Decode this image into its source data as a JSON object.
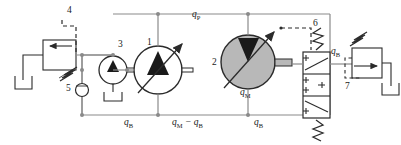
{
  "diagram": {
    "type": "hydraulic-schematic",
    "colors": {
      "line": "#8a8a8a",
      "dark_line": "#2b2b2b",
      "fill_gray": "#b8b8b8",
      "text": "#1a1a1a",
      "background": "#ffffff"
    },
    "components": [
      {
        "id": "1",
        "label": "1",
        "name": "variable-displacement-pump",
        "symbol": "circle-with-up-triangle-and-diagonal-arrow",
        "fill": "white"
      },
      {
        "id": "2",
        "label": "2",
        "name": "variable-displacement-motor",
        "symbol": "circle-with-down-triangle-and-diagonal-arrow",
        "fill": "gray"
      },
      {
        "id": "3",
        "label": "3",
        "name": "charge-pump",
        "symbol": "circle-with-up-triangle",
        "fill": "white"
      },
      {
        "id": "4",
        "label": "4",
        "name": "relief-valve-pilot-line",
        "symbol": "dashed-pilot-line"
      },
      {
        "id": "5",
        "label": "5",
        "name": "check-valve",
        "symbol": "circle-on-line"
      },
      {
        "id": "6",
        "label": "6",
        "name": "three-position-directional-valve",
        "symbol": "3-position-spring-centered-valve"
      },
      {
        "id": "7",
        "label": "7",
        "name": "relief-valve-pilot-line",
        "symbol": "dashed-pilot-line"
      }
    ],
    "flow_labels": [
      {
        "id": "qP",
        "base": "q",
        "sub": "P",
        "x": 196,
        "y": 12,
        "desc": "pump-flow-top-rail"
      },
      {
        "id": "qB-left",
        "base": "q",
        "sub": "B",
        "x": 127,
        "y": 121,
        "desc": "bleed-flow-left"
      },
      {
        "id": "qM-qB",
        "base": "q",
        "sub": "M",
        "x": 177,
        "y": 121,
        "desc": "motor-minus-bleed-flow",
        "suffix": " − q",
        "suffix_sub": "B"
      },
      {
        "id": "qB-mid",
        "base": "q",
        "sub": "B",
        "x": 257,
        "y": 121,
        "desc": "bleed-flow-right"
      },
      {
        "id": "qM",
        "base": "q",
        "sub": "M",
        "x": 243,
        "y": 90,
        "desc": "motor-flow"
      },
      {
        "id": "qB-valve",
        "base": "q",
        "sub": "B",
        "x": 329,
        "y": 53,
        "desc": "bleed-flow-valve-outlet"
      }
    ],
    "number_labels": [
      {
        "text": "4",
        "x": 67,
        "y": 8
      },
      {
        "text": "3",
        "x": 117,
        "y": 42
      },
      {
        "text": "1",
        "x": 146,
        "y": 40
      },
      {
        "text": "5",
        "x": 77,
        "y": 85
      },
      {
        "text": "2",
        "x": 213,
        "y": 63
      },
      {
        "text": "6",
        "x": 313,
        "y": 23
      },
      {
        "text": "7",
        "x": 345,
        "y": 84
      }
    ]
  }
}
